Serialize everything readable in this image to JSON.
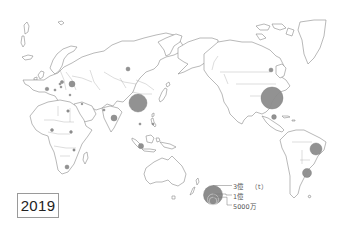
{
  "map": {
    "type": "proportional-symbol-world-map",
    "projection": "Pacific-centered",
    "year": "2019",
    "symbol_color": "#8c8c8c",
    "legend": {
      "unit": "（t）",
      "items": [
        {
          "label": "3億",
          "value": 300000000
        },
        {
          "label": "1億",
          "value": 100000000
        },
        {
          "label": "5000万",
          "value": 50000000
        }
      ]
    },
    "symbols": [
      {
        "region": "United States",
        "x": 272,
        "y": 98,
        "r": 11
      },
      {
        "region": "China",
        "x": 138,
        "y": 103,
        "r": 9
      },
      {
        "region": "Brazil",
        "x": 316,
        "y": 149,
        "r": 6
      },
      {
        "region": "Argentina",
        "x": 307,
        "y": 173,
        "r": 4.5
      },
      {
        "region": "Ukraine",
        "x": 72,
        "y": 84,
        "r": 3
      },
      {
        "region": "India",
        "x": 114,
        "y": 118,
        "r": 3
      },
      {
        "region": "Indonesia",
        "x": 141,
        "y": 146,
        "r": 2.6
      },
      {
        "region": "Mexico",
        "x": 274,
        "y": 117,
        "r": 2.4
      },
      {
        "region": "Russia",
        "x": 128,
        "y": 69,
        "r": 2
      },
      {
        "region": "Canada",
        "x": 271,
        "y": 70,
        "r": 2
      },
      {
        "region": "South Africa",
        "x": 67,
        "y": 167,
        "r": 2
      },
      {
        "region": "France",
        "x": 47,
        "y": 89,
        "r": 1.8
      },
      {
        "region": "Romania",
        "x": 62,
        "y": 82,
        "r": 1.6
      },
      {
        "region": "Nigeria",
        "x": 52,
        "y": 130,
        "r": 1.5
      },
      {
        "region": "Ethiopia",
        "x": 71,
        "y": 132,
        "r": 1.4
      },
      {
        "region": "Egypt",
        "x": 68,
        "y": 111,
        "r": 1.3
      },
      {
        "region": "Tanzania",
        "x": 74,
        "y": 150,
        "r": 1.2
      },
      {
        "region": "Philippines",
        "x": 153,
        "y": 124,
        "r": 1.1
      },
      {
        "region": "Vietnam",
        "x": 140,
        "y": 124,
        "r": 1.1
      },
      {
        "region": "Pakistan",
        "x": 104,
        "y": 110,
        "r": 1.1
      },
      {
        "region": "Italy",
        "x": 55,
        "y": 90,
        "r": 1.1
      },
      {
        "region": "Hungary",
        "x": 60,
        "y": 84,
        "r": 1.1
      },
      {
        "region": "Serbia",
        "x": 61,
        "y": 87,
        "r": 1.0
      },
      {
        "region": "Turkey",
        "x": 70,
        "y": 95,
        "r": 1.0
      },
      {
        "region": "Iran",
        "x": 82,
        "y": 104,
        "r": 0.9
      }
    ]
  }
}
